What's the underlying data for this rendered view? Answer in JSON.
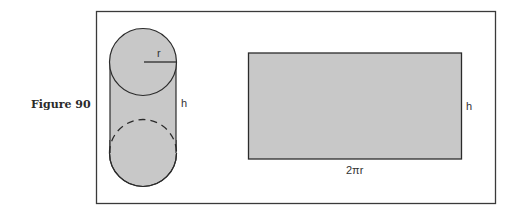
{
  "figure": {
    "caption": "Figure 90",
    "colors": {
      "fill": "#c8c8c8",
      "stroke": "#2b2b2b",
      "frame": "#3a3a3a"
    },
    "cylinder": {
      "radius_label": "r",
      "height_label": "h"
    },
    "rectangle": {
      "height_label": "h",
      "width_label": "2πr"
    }
  }
}
